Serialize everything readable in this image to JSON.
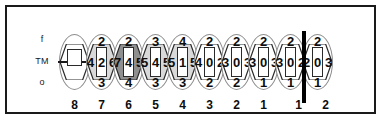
{
  "figure": {
    "type": "periodontal-chart",
    "row_labels": [
      "f",
      "TM",
      "o"
    ],
    "arch_divider": true
  },
  "teeth": [
    {
      "tooth_number": "8",
      "empty": true,
      "shade": "none",
      "top": "",
      "left": "",
      "mid": "",
      "right": "",
      "bottom": ""
    },
    {
      "tooth_number": "7",
      "empty": false,
      "shade": "light",
      "top": "2",
      "left": "4",
      "mid": "2",
      "right": "6",
      "bottom": "3"
    },
    {
      "tooth_number": "6",
      "empty": false,
      "shade": "dark",
      "top": "2",
      "left": "7",
      "mid": "4",
      "right": "5",
      "bottom": "4"
    },
    {
      "tooth_number": "5",
      "empty": false,
      "shade": "light",
      "top": "3",
      "left": "5",
      "mid": "4",
      "right": "5",
      "bottom": "3"
    },
    {
      "tooth_number": "4",
      "empty": false,
      "shade": "light",
      "top": "4",
      "left": "5",
      "mid": "1",
      "right": "5",
      "bottom": "3"
    },
    {
      "tooth_number": "3",
      "empty": false,
      "shade": "none",
      "top": "2",
      "left": "4",
      "mid": "0",
      "right": "2",
      "bottom": "2"
    },
    {
      "tooth_number": "2",
      "empty": false,
      "shade": "none",
      "top": "2",
      "left": "3",
      "mid": "0",
      "right": "3",
      "bottom": "2"
    },
    {
      "tooth_number": "1",
      "empty": false,
      "shade": "none",
      "top": "2",
      "left": "3",
      "mid": "0",
      "right": "3",
      "bottom": "1"
    },
    {
      "tooth_number": "1",
      "empty": false,
      "shade": "none",
      "top": "2",
      "left": "3",
      "mid": "0",
      "right": "2",
      "bottom": "1"
    },
    {
      "tooth_number": "2",
      "empty": false,
      "shade": "none",
      "top": "2",
      "left": "2",
      "mid": "0",
      "right": "3",
      "bottom": "1"
    }
  ],
  "colors": {
    "frame": "#1a1a1a",
    "divider": "#000000",
    "shade_light": "#d9d9d9",
    "shade_medium": "#cfcfcf",
    "shade_dark": "#8f8f8f",
    "text": "#0d0d0d",
    "outline": "#8d8d8d"
  }
}
